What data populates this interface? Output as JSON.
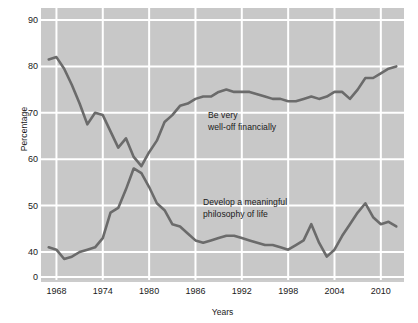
{
  "chart_data": {
    "type": "line",
    "title": "",
    "xlabel": "Years",
    "ylabel": "Percentage",
    "xlim": [
      1966,
      2013
    ],
    "ylim": [
      35,
      92
    ],
    "grid": true,
    "legend_position": "inline-annotations",
    "plot_background": "#c8c8c8",
    "gridline_color": "#ffffff",
    "line_color": "#6b6b6b",
    "xticks": [
      "1968",
      "1974",
      "1980",
      "1986",
      "1992",
      "1998",
      "2004",
      "2010"
    ],
    "xtick_values": [
      1968,
      1974,
      1980,
      1986,
      1992,
      1998,
      2004,
      2010
    ],
    "yticks": [
      "0",
      "40",
      "50",
      "60",
      "70",
      "80",
      "90"
    ],
    "ytick_values": [
      35,
      40,
      50,
      60,
      70,
      80,
      90
    ],
    "y_axis_break": true,
    "series": [
      {
        "name": "Be very well-off financially",
        "label_text": "Be very\nwell-off financially",
        "x": [
          1967,
          1968,
          1969,
          1970,
          1971,
          1972,
          1973,
          1974,
          1975,
          1976,
          1977,
          1978,
          1979,
          1980,
          1981,
          1982,
          1983,
          1984,
          1985,
          1986,
          1987,
          1988,
          1989,
          1990,
          1991,
          1992,
          1993,
          1994,
          1995,
          1996,
          1997,
          1998,
          1999,
          2000,
          2001,
          2002,
          2003,
          2004,
          2005,
          2006,
          2007,
          2008,
          2009,
          2010,
          2011,
          2012
        ],
        "values": [
          81.5,
          82,
          79.5,
          76,
          72,
          67.5,
          70,
          69.5,
          66,
          62.5,
          64.5,
          60.5,
          58.5,
          61.5,
          64,
          68,
          69.5,
          71.5,
          72,
          73,
          73.5,
          73.5,
          74.5,
          75,
          74.5,
          74.5,
          74.5,
          74,
          73.5,
          73,
          73,
          72.5,
          72.5,
          73,
          73.5,
          73,
          73.5,
          74.5,
          74.5,
          73,
          75,
          77.5,
          77.5,
          78.5,
          79.5,
          80
        ]
      },
      {
        "name": "Develop a meaningful philosophy of life",
        "label_text": "Develop a meaningful\nphilosophy of life",
        "x": [
          1967,
          1968,
          1969,
          1970,
          1971,
          1972,
          1973,
          1974,
          1975,
          1976,
          1977,
          1978,
          1979,
          1980,
          1981,
          1982,
          1983,
          1984,
          1985,
          1986,
          1987,
          1988,
          1989,
          1990,
          1991,
          1992,
          1993,
          1994,
          1995,
          1996,
          1997,
          1998,
          1999,
          2000,
          2001,
          2002,
          2003,
          2004,
          2005,
          2006,
          2007,
          2008,
          2009,
          2010,
          2011,
          2012
        ],
        "values": [
          41,
          40.5,
          38.5,
          39,
          40,
          40.5,
          41,
          43,
          48.5,
          49.5,
          53.5,
          58,
          57,
          54,
          50.5,
          49,
          46,
          45.5,
          44,
          42.5,
          42,
          42.5,
          43,
          43.5,
          43.5,
          43,
          42.5,
          42,
          41.5,
          41.5,
          41,
          40.5,
          41.5,
          42.5,
          46,
          42,
          39,
          40.5,
          43.5,
          46,
          48.5,
          50.5,
          47.5,
          46,
          46.5,
          45.5
        ]
      }
    ]
  }
}
